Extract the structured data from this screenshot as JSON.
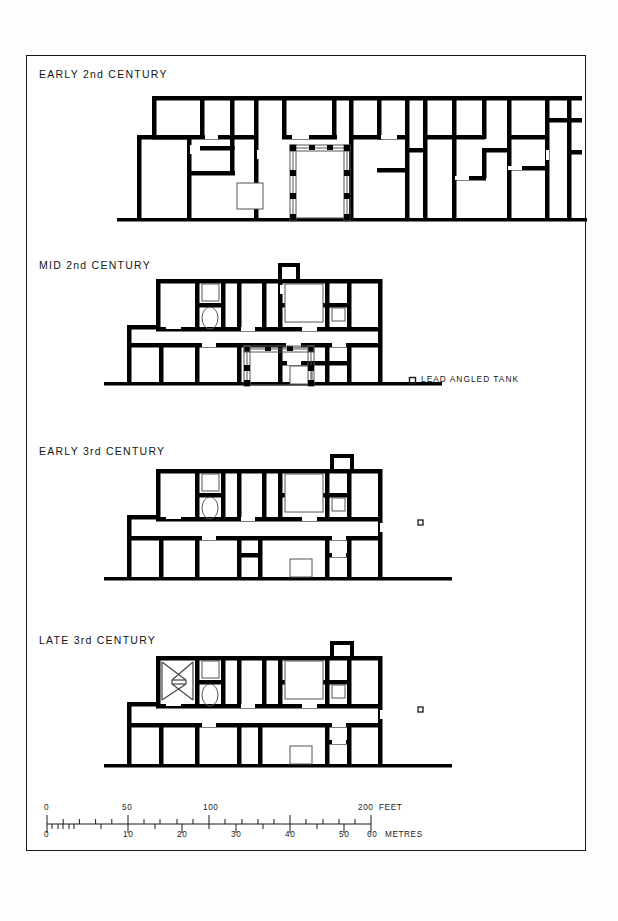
{
  "figure": {
    "type": "archaeological-site-plan-sequence",
    "panels": [
      {
        "id": "early-2nd",
        "title": "EARLY 2nd CENTURY"
      },
      {
        "id": "mid-2nd",
        "title": "MID 2nd CENTURY"
      },
      {
        "id": "early-3rd",
        "title": "EARLY 3rd CENTURY"
      },
      {
        "id": "late-3rd",
        "title": "LATE 3rd CENTURY"
      }
    ],
    "legend": {
      "symbol": "small-square",
      "label": "LEAD ANGLED TANK"
    },
    "scale": {
      "feet": {
        "unit_label": "FEET",
        "ticks": [
          0,
          10,
          20,
          30,
          40,
          50,
          60,
          70,
          80,
          90,
          100,
          110,
          120,
          130,
          140,
          150,
          160,
          170,
          180,
          190,
          200
        ],
        "labeled": [
          "0",
          "50",
          "100",
          "200"
        ],
        "max": 200
      },
      "metres": {
        "unit_label": "METRES",
        "ticks": [
          0,
          1,
          2,
          3,
          4,
          5,
          10,
          15,
          20,
          25,
          30,
          35,
          40,
          45,
          50,
          55,
          60
        ],
        "labeled": [
          "0",
          "10",
          "20",
          "30",
          "40",
          "50",
          "60"
        ],
        "max": 60
      }
    },
    "colors": {
      "wall": "#000000",
      "paper": "#ffffff",
      "border": "#1a1a1a",
      "text": "#151515",
      "thin_line": "#555555"
    }
  }
}
